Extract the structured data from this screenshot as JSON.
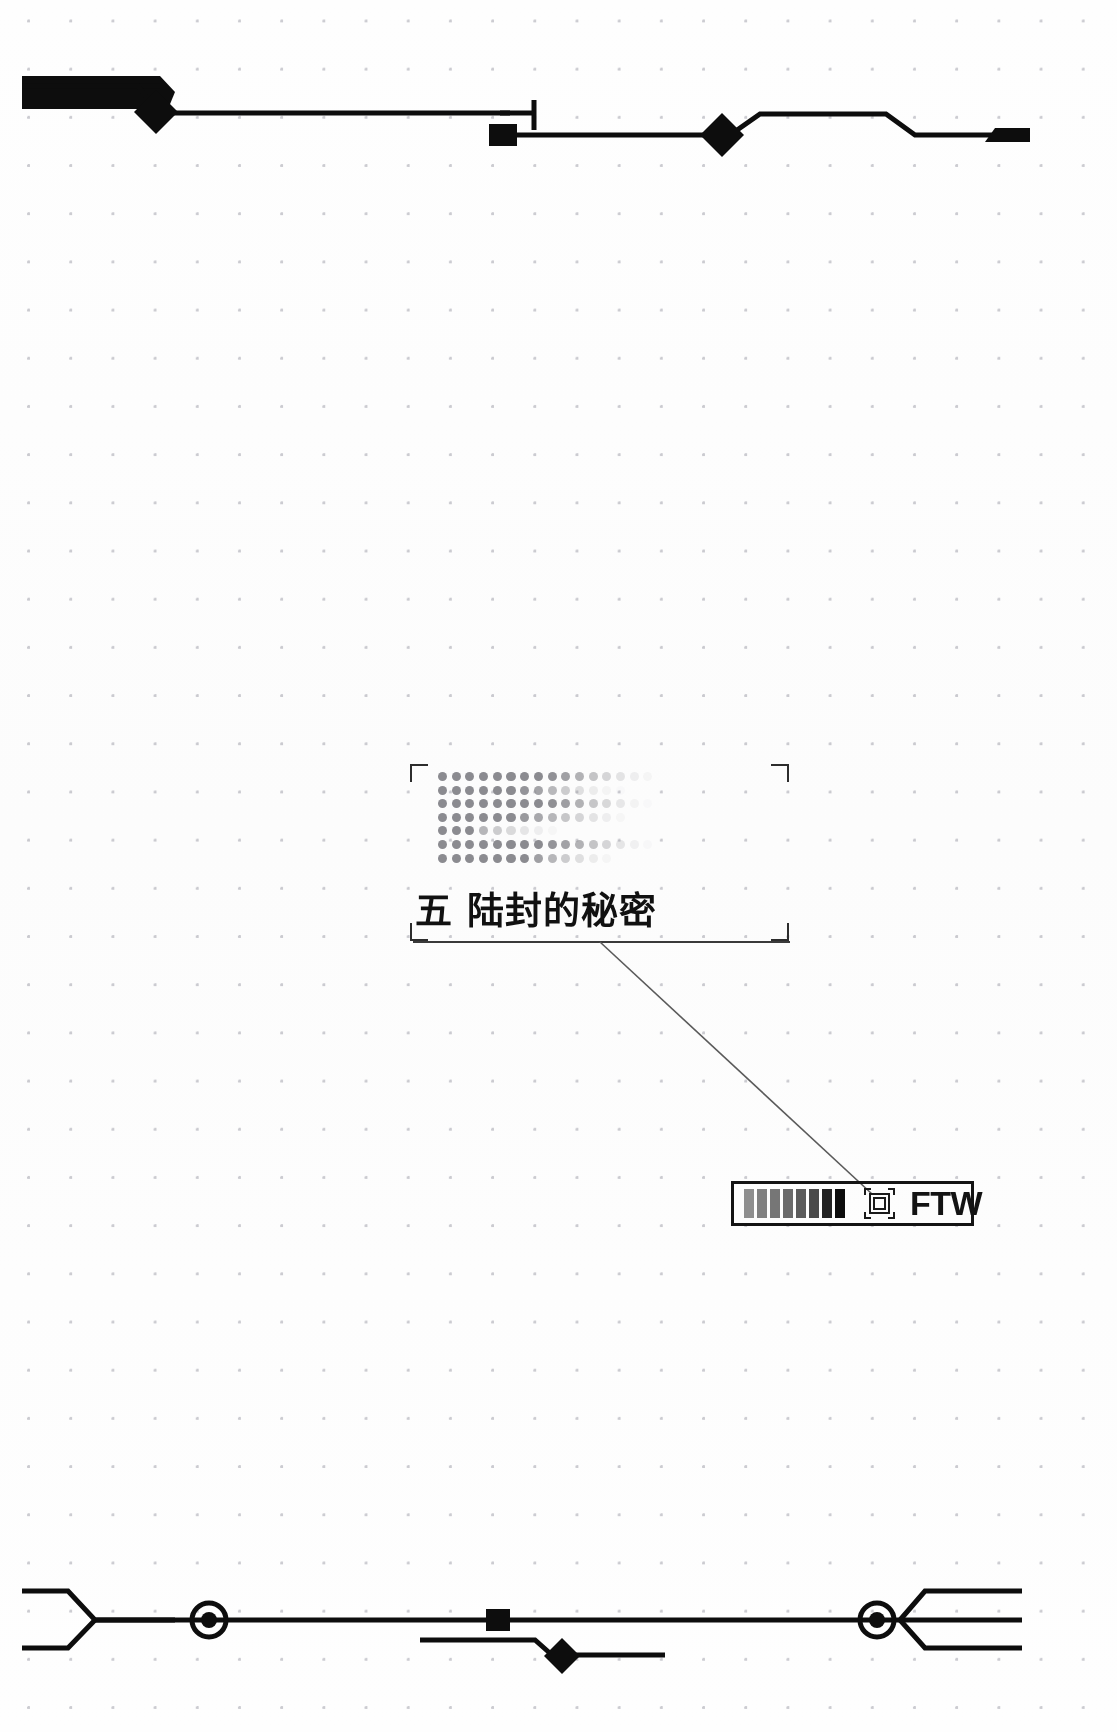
{
  "page": {
    "width": 1117,
    "height": 1732,
    "background_color": "#ffffff",
    "grid": {
      "dot_color": "#c9c9cf",
      "spacing_x": 42,
      "spacing_y": 48
    }
  },
  "chapter": {
    "number_label": "五",
    "title_text": "陆封的秘密",
    "full_title": "五  陆封的秘密",
    "text_color": "#111111",
    "rule_color": "#3a3a3a"
  },
  "halftone": {
    "label": "halftone-gradient-block",
    "dot_color": "#8b8b90",
    "rows": 7,
    "columns": 16,
    "row_opacities": [
      [
        1.0,
        1.0,
        1.0,
        1.0,
        1.0,
        1.0,
        1.0,
        1.0,
        0.95,
        0.82,
        0.66,
        0.5,
        0.34,
        0.22,
        0.12,
        0.06
      ],
      [
        1.0,
        1.0,
        1.0,
        1.0,
        1.0,
        1.0,
        0.92,
        0.78,
        0.6,
        0.42,
        0.26,
        0.14,
        0.07,
        0.03,
        0.0,
        0.0
      ],
      [
        1.0,
        1.0,
        1.0,
        1.0,
        1.0,
        1.0,
        1.0,
        1.0,
        0.96,
        0.84,
        0.66,
        0.48,
        0.32,
        0.18,
        0.08,
        0.03
      ],
      [
        1.0,
        1.0,
        1.0,
        1.0,
        1.0,
        1.0,
        0.88,
        0.74,
        0.62,
        0.48,
        0.34,
        0.22,
        0.12,
        0.05,
        0.0,
        0.0
      ],
      [
        1.0,
        1.0,
        1.0,
        0.62,
        0.42,
        0.3,
        0.2,
        0.12,
        0.05,
        0.0,
        0.0,
        0.0,
        0.0,
        0.0,
        0.0,
        0.0
      ],
      [
        1.0,
        1.0,
        1.0,
        1.0,
        1.0,
        1.0,
        1.0,
        1.0,
        0.92,
        0.8,
        0.66,
        0.5,
        0.34,
        0.2,
        0.1,
        0.04
      ],
      [
        1.0,
        1.0,
        1.0,
        1.0,
        1.0,
        1.0,
        1.0,
        0.82,
        0.62,
        0.42,
        0.26,
        0.14,
        0.06,
        0.0,
        0.0,
        0.0
      ]
    ]
  },
  "badge": {
    "label": "FTW",
    "frame_color": "#141414",
    "bar_count": 8,
    "bar_colors": [
      "#8e8e8e",
      "#808080",
      "#767676",
      "#6a6a6a",
      "#5b5b5b",
      "#4a4a4a",
      "#222222",
      "#0c0c0c"
    ],
    "icon_name": "target-square-icon"
  },
  "connector": {
    "name": "title-to-badge-leader-line",
    "color": "#5a5a5a",
    "from_x": 600,
    "from_y": 942,
    "to_x": 872,
    "to_y": 1194
  },
  "decor_top": {
    "name": "top-circuit-rule",
    "stroke_color": "#0d0d0d"
  },
  "decor_bottom": {
    "name": "bottom-circuit-rule",
    "stroke_color": "#0d0d0d"
  },
  "brackets": {
    "frame_top_left": "corner-bracket-top-left",
    "frame_top_right": "corner-bracket-top-right",
    "frame_bottom_left": "corner-bracket-bottom-left",
    "frame_bottom_right": "corner-bracket-bottom-right"
  }
}
